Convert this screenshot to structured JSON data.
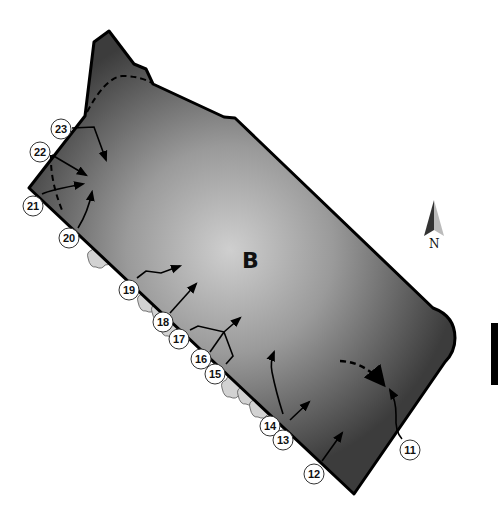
{
  "diagram": {
    "zone_label": "B",
    "north_label": "N",
    "colors": {
      "area_dark": "#3a3a3a",
      "area_light": "#c8c8c8",
      "outline": "#000000",
      "shrub_fill": "#d4d4d4",
      "label_bg": "#ffffff"
    },
    "markers": [
      {
        "id": "11",
        "label": "11"
      },
      {
        "id": "12",
        "label": "12"
      },
      {
        "id": "13",
        "label": "13"
      },
      {
        "id": "14",
        "label": "14"
      },
      {
        "id": "15",
        "label": "15"
      },
      {
        "id": "16",
        "label": "16"
      },
      {
        "id": "17",
        "label": "17"
      },
      {
        "id": "18",
        "label": "18"
      },
      {
        "id": "19",
        "label": "19"
      },
      {
        "id": "20",
        "label": "20"
      },
      {
        "id": "21",
        "label": "21"
      },
      {
        "id": "22",
        "label": "22"
      },
      {
        "id": "23",
        "label": "23"
      }
    ]
  }
}
